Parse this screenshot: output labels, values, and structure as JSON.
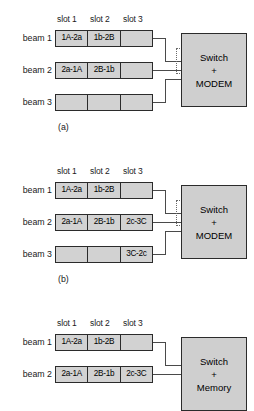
{
  "figure": {
    "slot_headers": [
      "slot 1",
      "slot 2",
      "slot 3"
    ],
    "beam_labels": [
      "beam 1",
      "beam 2",
      "beam 3"
    ],
    "panels": [
      {
        "caption": "(a)",
        "node": {
          "line1": "Switch",
          "line2": "+",
          "line3": "MODEM"
        },
        "beams": [
          {
            "label": "beam 1",
            "cells": [
              "1A-2a",
              "1b-2B",
              ""
            ]
          },
          {
            "label": "beam 2",
            "cells": [
              "2a-1A",
              "2B-1b",
              ""
            ]
          },
          {
            "label": "beam 3",
            "cells": [
              "",
              "",
              ""
            ]
          }
        ]
      },
      {
        "caption": "(b)",
        "node": {
          "line1": "Switch",
          "line2": "+",
          "line3": "MODEM"
        },
        "beams": [
          {
            "label": "beam 1",
            "cells": [
              "1A-2a",
              "1b-2B",
              ""
            ]
          },
          {
            "label": "beam 2",
            "cells": [
              "2a-1A",
              "2B-1b",
              "2c-3C"
            ]
          },
          {
            "label": "beam 3",
            "cells": [
              "",
              "",
              "3C-2c"
            ]
          }
        ]
      },
      {
        "caption": "",
        "node": {
          "line1": "Switch",
          "line2": "+",
          "line3": "Memory"
        },
        "beams": [
          {
            "label": "beam 1",
            "cells": [
              "1A-2a",
              "1b-2B",
              ""
            ]
          },
          {
            "label": "beam 2",
            "cells": [
              "2a-1A",
              "2B-1b",
              "2c-3C"
            ]
          }
        ]
      }
    ],
    "colors": {
      "cell_fill": "#d2d2d2",
      "node_fill": "#cfcfcf",
      "stroke": "#2b2b2b",
      "wire": "#4a4a4a",
      "background": "#ffffff"
    }
  }
}
